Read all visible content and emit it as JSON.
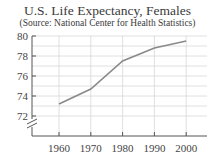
{
  "chart_data": {
    "type": "line",
    "title": "U.S. Life Expectancy, Females",
    "subtitle": "(Source: National Center for Health Statistics)",
    "xlabel": "",
    "ylabel": "",
    "x": [
      1960,
      1970,
      1980,
      1990,
      2000
    ],
    "series": [
      {
        "name": "Life expectancy (females)",
        "values": [
          73.2,
          74.7,
          77.5,
          78.8,
          79.5
        ]
      }
    ],
    "xticks": [
      "1960",
      "1970",
      "1980",
      "1990",
      "2000"
    ],
    "yticks": [
      "72",
      "74",
      "76",
      "78",
      "80"
    ],
    "ylim": [
      72,
      80
    ],
    "axis_break": true,
    "grid": true,
    "legend": "none",
    "colors": {
      "line": "#8a8a8a",
      "grid": "#d8d8d8",
      "axis": "#555555"
    }
  }
}
